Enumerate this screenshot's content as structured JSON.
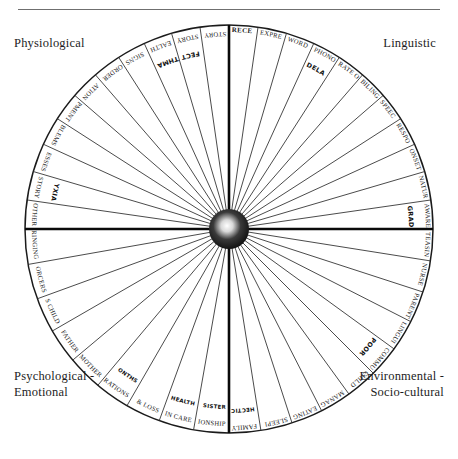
{
  "document": {
    "title": "Assessment Wheel",
    "type": "radial-sector-diagram"
  },
  "quadrant_labels": {
    "physiological": "Physiological",
    "linguistic": "Linguistic",
    "psychological": "Psychological -\nEmotional",
    "environmental": "Environmental -\nSocio-cultural"
  },
  "colors": {
    "ink": "#161616",
    "rule": "#6f6f6f",
    "hub_dark": "#151515",
    "hub_light": "#f2f2f2",
    "paper": "#ffffff"
  },
  "chart_data": {
    "type": "pie",
    "legend_position": "corners",
    "quadrants": [
      {
        "name": "Physiological",
        "angle_range_deg": [
          180,
          270
        ],
        "segments": [
          {
            "label": "OTHER",
            "annotation": ""
          },
          {
            "label": "BIRTH HISTORY",
            "annotation": "ASPHYXIA"
          },
          {
            "label": "SPEECH MOTOR PROCESSES",
            "annotation": ""
          },
          {
            "label": "PERCEPTUAL PROBLEMS",
            "annotation": ""
          },
          {
            "label": "MOTOR DEVELOPMENT",
            "annotation": ""
          },
          {
            "label": "MOTOR CO-ORDINATION",
            "annotation": ""
          },
          {
            "label": "ATTENTION DISORDER",
            "annotation": ""
          },
          {
            "label": "NEUROLOGICAL SIGNS",
            "annotation": ""
          },
          {
            "label": "GENERAL HEALTH",
            "annotation": "ECZEMA ASTHMA"
          },
          {
            "label": "DEVELOPMENTAL HISTORY",
            "annotation": "HEART DEFECT"
          },
          {
            "label": "FAMILY HISTORY",
            "annotation": ""
          }
        ]
      },
      {
        "name": "Linguistic",
        "angle_range_deg": [
          270,
          360
        ],
        "segments": [
          {
            "label": "RECEPTIVE LANGUAGE",
            "annotation": "",
            "bold": true
          },
          {
            "label": "EXPRESSIVE LANGUAGE - VOCABULARY",
            "annotation": ""
          },
          {
            "label": "WORD RETRIEVAL",
            "annotation": ""
          },
          {
            "label": "PHONOLOGY",
            "annotation": "DELAYED DEVELOPMENT"
          },
          {
            "label": "RATE OF SPEECH",
            "annotation": ""
          },
          {
            "label": "BILINGUALISM",
            "annotation": ""
          },
          {
            "label": "SPEECH & LANGUAGE DEVELOPMENT",
            "annotation": ""
          },
          {
            "label": "RESPONSE TO DYSFLUENCY",
            "annotation": ""
          },
          {
            "label": "ONSET OF DYSFLUENCY",
            "annotation": ""
          },
          {
            "label": "NATURE OF DYSFLUENCY",
            "annotation": ""
          },
          {
            "label": "AWARENESS",
            "annotation": "GRADUAL"
          }
        ]
      },
      {
        "name": "Environmental - Socio-cultural",
        "angle_range_deg": [
          0,
          90
        ],
        "segments": [
          {
            "label": "TEASING",
            "annotation": ""
          },
          {
            "label": "NURSERY SCHOOL ENVIRONMENT",
            "annotation": ""
          },
          {
            "label": "PARENTAL EXPECTATIONS",
            "annotation": ""
          },
          {
            "label": "LINGUISTIC ENVIRONMENT",
            "annotation": ""
          },
          {
            "label": "COMMUNICATIVE ENVIRONMENT",
            "annotation": "POOR TURN TAKING"
          },
          {
            "label": "CHILD REARING PRACTICES",
            "annotation": ""
          },
          {
            "label": "MANAGEMENT ISSUES",
            "annotation": ""
          },
          {
            "label": "EATING ROUTINES",
            "annotation": ""
          },
          {
            "label": "SLEEPING ROUTINES",
            "annotation": ""
          },
          {
            "label": "FAMILY CIRCUMSTANCES",
            "annotation": "HECTIC LIFESTYLE SIBLING ISSUES"
          }
        ]
      },
      {
        "name": "Psychological - Emotional",
        "angle_range_deg": [
          90,
          180
        ],
        "segments": [
          {
            "label": "MARITAL RELATIONSHIP",
            "annotation": "BRIGHT OLDER BRIGHT VERBAL YOUNGER SISTER"
          },
          {
            "label": "CHANGES IN CARE",
            "annotation": "ANXIETY RE MUMMY GEORGE'S HEALTH"
          },
          {
            "label": "BEREAVEMENTS & LOSS",
            "annotation": ""
          },
          {
            "label": "SEPARATIONS",
            "annotation": "MUM MOTHER AT 12 MONTHS"
          },
          {
            "label": "PERSONALITY TRAITS MOTHER",
            "annotation": ""
          },
          {
            "label": "PERSONALITY TRAITS FATHER",
            "annotation": ""
          },
          {
            "label": "PERSONALITY TRAITS CHILD",
            "annotation": ""
          },
          {
            "label": "REINFORCERS",
            "annotation": ""
          },
          {
            "label": "PARENTS' UPBRINGING",
            "annotation": ""
          }
        ]
      }
    ]
  }
}
